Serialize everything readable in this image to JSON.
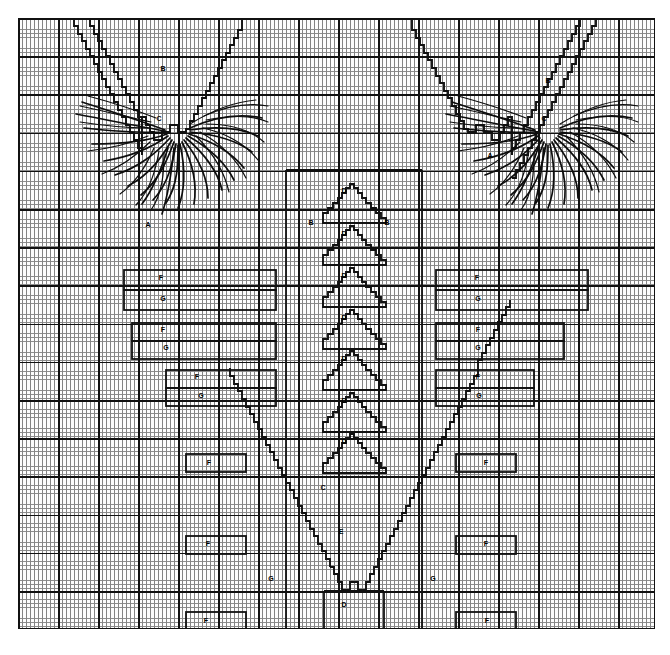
{
  "document": {
    "type": "needlework-chart",
    "title": "Shawl / V-neck knitting chart",
    "background_color": "#ffffff",
    "ink_color": "#111111",
    "grid": {
      "fine_cell_w_px": 4.0,
      "fine_cell_h_px": 3.8,
      "major_cell_w_px": 40,
      "major_cell_h_px": 38.2,
      "fine_color": "#6f6f6f",
      "major_color": "#111111"
    }
  },
  "labels": [
    {
      "text": "B",
      "x": 163,
      "y": 68,
      "name": "label-b-left-neck"
    },
    {
      "text": "C",
      "x": 159,
      "y": 118,
      "name": "label-c-left-neck"
    },
    {
      "text": "B",
      "x": 548,
      "y": 80,
      "name": "label-b-right-neck"
    },
    {
      "text": "C",
      "x": 544,
      "y": 118,
      "name": "label-c-right-neck"
    },
    {
      "text": "A",
      "x": 148,
      "y": 224,
      "name": "label-a-left-body"
    },
    {
      "text": "A",
      "x": 490,
      "y": 155,
      "name": "label-a-right-body"
    },
    {
      "text": "B",
      "x": 311,
      "y": 222,
      "name": "label-b-center-left"
    },
    {
      "text": "B",
      "x": 387,
      "y": 222,
      "name": "label-b-center-right"
    },
    {
      "text": "D",
      "x": 344,
      "y": 190,
      "name": "label-d-motif-1"
    },
    {
      "text": "D",
      "x": 344,
      "y": 233,
      "name": "label-d-motif-2"
    },
    {
      "text": "D",
      "x": 344,
      "y": 275,
      "name": "label-d-motif-3"
    },
    {
      "text": "D",
      "x": 344,
      "y": 317,
      "name": "label-d-motif-4"
    },
    {
      "text": "D",
      "x": 344,
      "y": 358,
      "name": "label-d-motif-5"
    },
    {
      "text": "D",
      "x": 344,
      "y": 400,
      "name": "label-d-motif-6"
    },
    {
      "text": "D",
      "x": 344,
      "y": 441,
      "name": "label-d-motif-7"
    },
    {
      "text": "C",
      "x": 323,
      "y": 487,
      "name": "label-c-lower-center"
    },
    {
      "text": "E",
      "x": 341,
      "y": 531,
      "name": "label-e-lower-center"
    },
    {
      "text": "D",
      "x": 344,
      "y": 604,
      "name": "label-d-lower-box"
    },
    {
      "text": "F",
      "x": 161,
      "y": 277,
      "name": "label-f-left-1"
    },
    {
      "text": "G",
      "x": 163,
      "y": 298,
      "name": "label-g-left-1"
    },
    {
      "text": "F",
      "x": 163,
      "y": 329,
      "name": "label-f-left-2"
    },
    {
      "text": "G",
      "x": 166,
      "y": 347,
      "name": "label-g-left-2"
    },
    {
      "text": "F",
      "x": 197,
      "y": 376,
      "name": "label-f-left-3"
    },
    {
      "text": "G",
      "x": 201,
      "y": 395,
      "name": "label-g-left-3"
    },
    {
      "text": "F",
      "x": 209,
      "y": 462,
      "name": "label-f-left-4"
    },
    {
      "text": "F",
      "x": 208,
      "y": 543,
      "name": "label-f-left-5"
    },
    {
      "text": "G",
      "x": 271,
      "y": 578,
      "name": "label-g-left-6"
    },
    {
      "text": "F",
      "x": 206,
      "y": 620,
      "name": "label-f-left-7"
    },
    {
      "text": "F",
      "x": 477,
      "y": 277,
      "name": "label-f-right-1"
    },
    {
      "text": "G",
      "x": 478,
      "y": 298,
      "name": "label-g-right-1"
    },
    {
      "text": "F",
      "x": 478,
      "y": 329,
      "name": "label-f-right-2"
    },
    {
      "text": "G",
      "x": 478,
      "y": 347,
      "name": "label-g-right-2"
    },
    {
      "text": "F",
      "x": 478,
      "y": 376,
      "name": "label-f-right-3"
    },
    {
      "text": "G",
      "x": 479,
      "y": 395,
      "name": "label-g-right-3"
    },
    {
      "text": "F",
      "x": 486,
      "y": 462,
      "name": "label-f-right-4"
    },
    {
      "text": "F",
      "x": 486,
      "y": 543,
      "name": "label-f-right-5"
    },
    {
      "text": "G",
      "x": 433,
      "y": 578,
      "name": "label-g-right-6"
    },
    {
      "text": "F",
      "x": 487,
      "y": 620,
      "name": "label-f-right-7"
    }
  ],
  "chart_data": {
    "type": "diagram",
    "legend_letters": [
      "A",
      "B",
      "C",
      "D",
      "E",
      "F",
      "G"
    ],
    "motifs": {
      "center_triangles": {
        "letter": "D",
        "count": 7,
        "description": "stacked stepped triangles down center column"
      },
      "neck_plumes": {
        "letters": [
          "B",
          "C"
        ],
        "count": 2,
        "description": "hand drawn fringe / feather plumes at upper left and upper right"
      },
      "v_outline": {
        "letters": [
          "A",
          "B",
          "C",
          "E"
        ],
        "description": "large stepped V / chevron outlines forming neckline and lower point"
      },
      "placement_boxes": {
        "letters": [
          "F",
          "G"
        ],
        "count": 20,
        "description": "rectangular placement markers mirrored left and right"
      }
    }
  }
}
